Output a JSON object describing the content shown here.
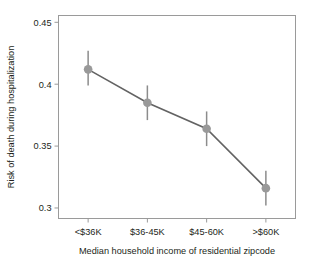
{
  "chart_data": {
    "type": "line",
    "title": "",
    "xlabel": "Median household income of residential zipcode",
    "ylabel": "Risk of death during hospitalization",
    "categories": [
      "<$36K",
      "$36-45K",
      "$45-60K",
      ">$60K"
    ],
    "values": [
      0.412,
      0.385,
      0.364,
      0.316
    ],
    "error_low": [
      0.399,
      0.371,
      0.35,
      0.302
    ],
    "error_high": [
      0.427,
      0.399,
      0.378,
      0.33
    ],
    "yticks": [
      0.45,
      0.4,
      0.35,
      0.3
    ],
    "ytick_labels": [
      "0.45",
      "0.4",
      "0.35",
      "0.3"
    ],
    "ylim": [
      0.2915,
      0.4555
    ],
    "grid": false,
    "legend": null,
    "series": [
      {
        "name": "Risk of death during hospitalization",
        "values": [
          0.412,
          0.385,
          0.364,
          0.316
        ],
        "error_low": [
          0.399,
          0.371,
          0.35,
          0.302
        ],
        "error_high": [
          0.427,
          0.399,
          0.378,
          0.33
        ]
      }
    ],
    "colors": {
      "marker": "#999999",
      "errorbar": "#8c8c8c",
      "line": "#636363",
      "axis": "#9a9a9a",
      "text": "#231f20",
      "background": "#ffffff"
    }
  },
  "axis": {
    "x_title": "Median household income of residential zipcode",
    "y_title": "Risk of death during hospitalization",
    "x_tick_labels": [
      "<$36K",
      "$36-45K",
      "$45-60K",
      ">$60K"
    ],
    "y_tick_labels": [
      "0.45",
      "0.4",
      "0.35",
      "0.3"
    ]
  }
}
